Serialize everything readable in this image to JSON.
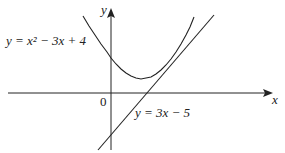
{
  "diagram": {
    "axes": {
      "x_label": "x",
      "y_label": "y",
      "origin_label": "0"
    },
    "curves": [
      {
        "name": "parabola",
        "label": "y = x² − 3x + 4",
        "equation": "y = x^2 - 3x + 4"
      },
      {
        "name": "tangent-line",
        "label": "y = 3x − 5",
        "equation": "y = 3x - 5"
      }
    ],
    "colors": {
      "stroke": "#222222",
      "background": "#ffffff"
    }
  }
}
